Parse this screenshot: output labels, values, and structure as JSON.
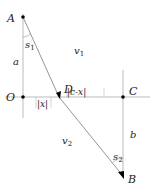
{
  "diagram": {
    "points": {
      "A": {
        "label": "A"
      },
      "B": {
        "label": "B"
      },
      "O": {
        "label": "O"
      },
      "C": {
        "label": "C"
      },
      "D": {
        "label": "D"
      }
    },
    "segment_labels": {
      "a": "a",
      "b": "b",
      "x": "|x|",
      "c_minus_x": "|c-x|"
    },
    "angles": {
      "s1": {
        "base": "s",
        "sub": "1"
      },
      "s2": {
        "base": "s",
        "sub": "2"
      }
    },
    "regions": {
      "v1": {
        "base": "v",
        "sub": "1"
      },
      "v2": {
        "base": "v",
        "sub": "2"
      }
    },
    "colors": {
      "line": "#888888",
      "axis": "#aaaaaa",
      "point": "#000000",
      "text": "#222222"
    }
  }
}
